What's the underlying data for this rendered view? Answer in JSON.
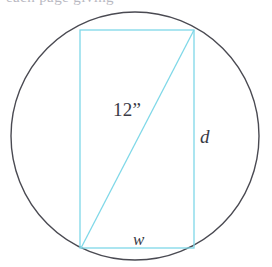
{
  "figure": {
    "name": "rectangle-inscribed-in-circle",
    "clipped_header_text": "each page giving",
    "colors": {
      "circle_stroke": "#4a4a52",
      "rectangle_stroke": "#7fd8e8",
      "diagonal_stroke": "#7fd8e8",
      "label_text": "#3a3a46",
      "background": "#ffffff"
    },
    "circle": {
      "center_x": 135,
      "center_y": 136,
      "radius": 124,
      "stroke_width": 1.4
    },
    "rectangle": {
      "x": 80,
      "y": 30,
      "width": 114,
      "height": 218,
      "stroke_width": 1.3
    },
    "diagonal": {
      "x1": 81,
      "y1": 248,
      "x2": 194,
      "y2": 30,
      "stroke_width": 1.3
    },
    "labels": {
      "diagonal_value": "12",
      "diagonal_unit": "”",
      "diagonal_full": "12”",
      "depth": "d",
      "width": "w"
    }
  }
}
